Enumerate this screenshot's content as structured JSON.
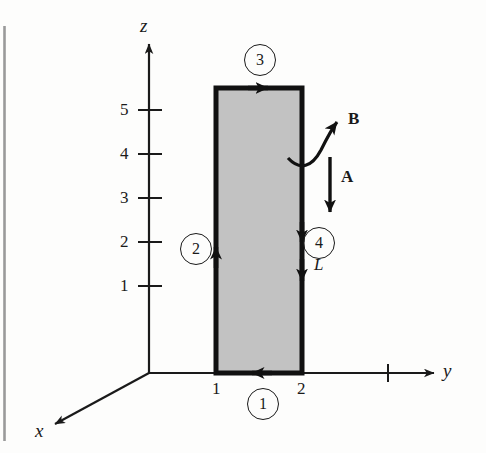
{
  "figure": {
    "background_color": "#fdfdfc",
    "ink_color": "#1a1a1a",
    "loop_fill_color": "#c2c2c2",
    "page_edge_color": "#9a9a9a"
  },
  "axes": {
    "z": {
      "label": "z",
      "ticks": [
        "5",
        "4",
        "3",
        "2",
        "1"
      ],
      "tick_values": [
        5,
        4,
        3,
        2,
        1
      ]
    },
    "y": {
      "label": "y",
      "ticks": [
        "1",
        "2"
      ],
      "tick_values": [
        1,
        2
      ],
      "unlabeled_tick_value": 3
    },
    "x": {
      "label": "x",
      "ticks": []
    }
  },
  "loop": {
    "name": "current-loop",
    "y_from": 1,
    "y_to": 2,
    "z_from": 0,
    "z_to": 5.35,
    "segments": [
      {
        "id": "1",
        "label": "1",
        "edge": "bottom",
        "direction": "left"
      },
      {
        "id": "2",
        "label": "2",
        "edge": "left",
        "direction": "up"
      },
      {
        "id": "3",
        "label": "3",
        "edge": "top",
        "direction": "right"
      },
      {
        "id": "4",
        "label": "4",
        "edge": "right",
        "direction": "down"
      }
    ]
  },
  "annotations": {
    "field_vector": {
      "label": "B",
      "description": "magnetic field, curved arrow pointing up-right"
    },
    "area_vector": {
      "label": "A",
      "description": "area vector, straight arrow pointing down"
    },
    "length_label": {
      "label": "L",
      "description": "length element on right edge"
    }
  }
}
